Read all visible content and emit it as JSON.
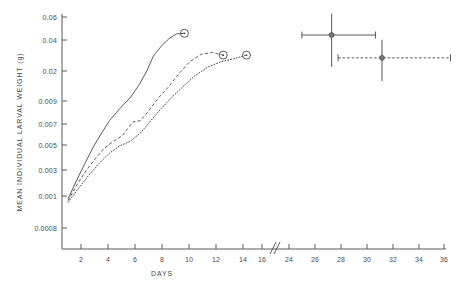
{
  "chart_data": {
    "type": "line",
    "title": "",
    "xlabel": "DAYS",
    "ylabel": "MEAN INDIVIDUAL LARVAL WEIGHT (g)",
    "yscale": "log",
    "ylim": [
      0.0008,
      0.06
    ],
    "xlim": [
      0,
      36
    ],
    "grid": false,
    "legend": "none",
    "axis_break": {
      "present": true,
      "between": [
        16,
        24
      ],
      "symbol": "//"
    },
    "ytick_labels": [
      "0.06",
      "0.04",
      "0.02",
      "0.009",
      "0.007",
      "0.005",
      "0.003",
      "0.001",
      "0.0008"
    ],
    "ytick_values": [
      0.06,
      0.04,
      0.02,
      0.009,
      0.007,
      0.005,
      0.003,
      0.001,
      0.0008
    ],
    "xtick_labels": [
      "2",
      "4",
      "6",
      "8",
      "10",
      "12",
      "14",
      "16",
      "24",
      "26",
      "28",
      "30",
      "32",
      "34",
      "36"
    ],
    "xtick_values": [
      2,
      4,
      6,
      8,
      10,
      12,
      14,
      16,
      24,
      26,
      28,
      30,
      32,
      34,
      36
    ],
    "series": [
      {
        "name": "curve-solid",
        "style": "solid",
        "end_marker": "open-circle-with-dot",
        "x": [
          1.0,
          1.6,
          2.3,
          3.0,
          3.6,
          4.2,
          5.0,
          5.8,
          6.5,
          7.1,
          7.6,
          8.2,
          8.8,
          9.4,
          10.0
        ],
        "y": [
          0.00145,
          0.00205,
          0.003,
          0.0043,
          0.0056,
          0.0072,
          0.0092,
          0.0115,
          0.015,
          0.02,
          0.027,
          0.033,
          0.0385,
          0.0425,
          0.043
        ]
      },
      {
        "name": "curve-dashed",
        "style": "dashed",
        "end_marker": "open-circle-with-dot",
        "x": [
          1.0,
          1.7,
          2.4,
          3.1,
          3.8,
          4.5,
          5.2,
          6.0,
          6.6,
          7.3,
          8.0,
          8.8,
          9.6,
          10.4,
          11.3,
          12.1,
          13.0
        ],
        "y": [
          0.0014,
          0.00195,
          0.0026,
          0.0033,
          0.0041,
          0.0047,
          0.0053,
          0.007,
          0.0072,
          0.009,
          0.0115,
          0.0145,
          0.019,
          0.024,
          0.028,
          0.029,
          0.0275
        ]
      },
      {
        "name": "curve-dotted",
        "style": "dotted",
        "end_marker": "open-circle-with-dot",
        "x": [
          1.0,
          1.8,
          2.6,
          3.4,
          4.2,
          5.0,
          5.8,
          6.6,
          7.4,
          8.2,
          9.0,
          9.9,
          10.8,
          11.8,
          12.8,
          13.8,
          14.8
        ],
        "y": [
          0.00135,
          0.0018,
          0.00235,
          0.003,
          0.0037,
          0.0043,
          0.0047,
          0.0056,
          0.0072,
          0.0092,
          0.0115,
          0.0145,
          0.018,
          0.0215,
          0.024,
          0.0255,
          0.0275
        ]
      }
    ],
    "error_points": [
      {
        "name": "point-solid",
        "style": "solid",
        "x": 27.3,
        "y": 0.0415,
        "x_err_low": 2.3,
        "x_err_high": 3.4,
        "y_err_up_factor": 1.55,
        "y_err_down_factor": 0.52
      },
      {
        "name": "point-dashed",
        "style": "dashed",
        "x": 31.2,
        "y": 0.026,
        "x_err_low": 3.4,
        "x_err_high": 5.3,
        "y_err_up_factor": 1.45,
        "y_err_down_factor": 0.62
      }
    ]
  },
  "figure": {
    "background_color": "#ffffff",
    "line_color": "#4a4a4a",
    "axis_color": "#5a5a5a"
  }
}
